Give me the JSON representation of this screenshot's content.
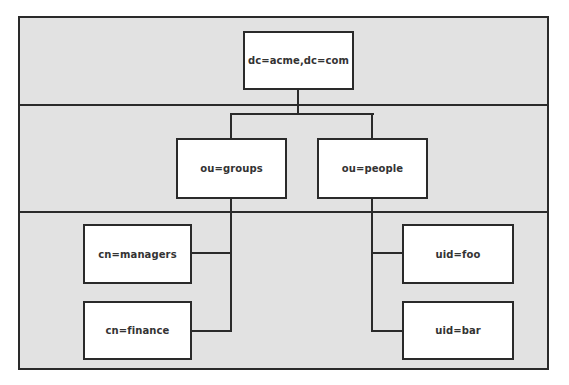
{
  "diagram": {
    "type": "ldap-directory-tree",
    "colors": {
      "band_background": "#e2e2e2",
      "node_background": "#ffffff",
      "border": "#2a2a2a",
      "text": "#333333"
    },
    "levels": [
      {
        "name": "root",
        "nodes": [
          {
            "id": "root",
            "label": "dc=acme,dc=com"
          }
        ]
      },
      {
        "name": "organizational-units",
        "nodes": [
          {
            "id": "groups",
            "label": "ou=groups",
            "parent": "root"
          },
          {
            "id": "people",
            "label": "ou=people",
            "parent": "root"
          }
        ]
      },
      {
        "name": "entries",
        "nodes": [
          {
            "id": "managers",
            "label": "cn=managers",
            "parent": "groups"
          },
          {
            "id": "finance",
            "label": "cn=finance",
            "parent": "groups"
          },
          {
            "id": "foo",
            "label": "uid=foo",
            "parent": "people"
          },
          {
            "id": "bar",
            "label": "uid=bar",
            "parent": "people"
          }
        ]
      }
    ],
    "edges": [
      [
        "root",
        "groups"
      ],
      [
        "root",
        "people"
      ],
      [
        "groups",
        "managers"
      ],
      [
        "groups",
        "finance"
      ],
      [
        "people",
        "foo"
      ],
      [
        "people",
        "bar"
      ]
    ]
  }
}
